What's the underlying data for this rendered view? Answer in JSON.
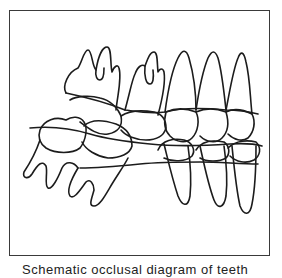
{
  "figure": {
    "type": "line-drawing",
    "frame_color": "#3a3a3a",
    "stroke_color": "#1c1c1c",
    "background": "#ffffff",
    "teeth": {
      "upper": [
        "molar-1",
        "molar-2",
        "premolar-1",
        "premolar-2",
        "canine"
      ],
      "lower": [
        "molar-1",
        "molar-2",
        "premolar-1",
        "premolar-2",
        "canine"
      ]
    }
  },
  "caption": {
    "text": "Schematic occlusal diagram of teeth",
    "clipped": true
  }
}
